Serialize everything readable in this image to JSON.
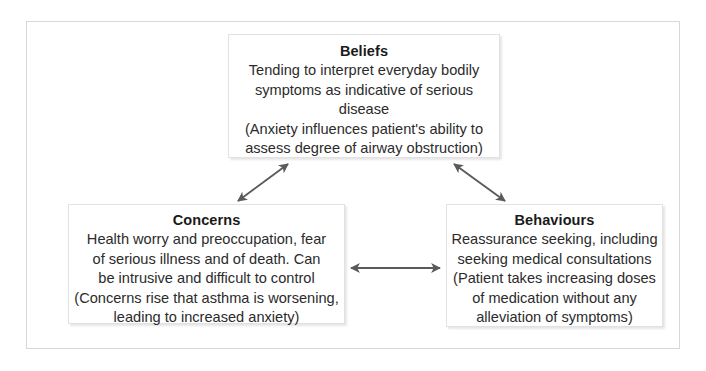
{
  "figure": {
    "type": "cognitive-behavioural-cycle-diagram",
    "frame_color": "#d8d8d8",
    "box_border_color": "#e2e2e2",
    "arrow_color": "#5a5a5a",
    "text_color": "#2b2b2b",
    "title_color": "#1a1a1a"
  },
  "boxes": {
    "beliefs": {
      "title": "Beliefs",
      "body": "Tending to interpret everyday bodily\nsymptoms as indicative of serious disease\n(Anxiety influences patient's ability to\nassess degree of airway obstruction)"
    },
    "concerns": {
      "title": "Concerns",
      "body": "Health worry and preoccupation, fear\nof serious illness and of death. Can\nbe intrusive and difficult to control\n(Concerns rise that asthma is worsening,\nleading to increased anxiety)"
    },
    "behaviours": {
      "title": "Behaviours",
      "body": "Reassurance seeking, including\nseeking medical consultations\n(Patient takes increasing doses\nof medication without any\nalleviation of symptoms)"
    }
  },
  "arrows": [
    {
      "name": "beliefs-concerns-arrow",
      "from": "Concerns",
      "to": "Beliefs",
      "style": "double-headed",
      "orientation": "diagonal-up-right"
    },
    {
      "name": "beliefs-behaviours-arrow",
      "from": "Beliefs",
      "to": "Behaviours",
      "style": "double-headed",
      "orientation": "diagonal-down-right"
    },
    {
      "name": "concerns-behaviours-arrow",
      "from": "Concerns",
      "to": "Behaviours",
      "style": "double-headed",
      "orientation": "horizontal"
    }
  ]
}
